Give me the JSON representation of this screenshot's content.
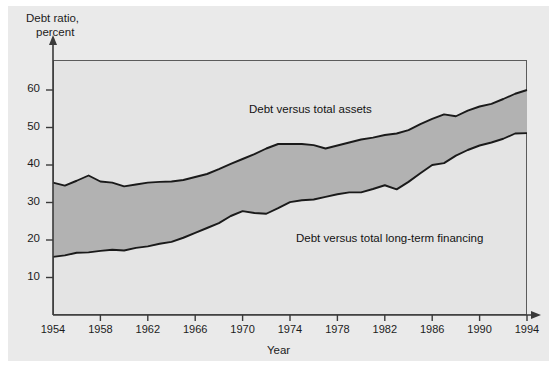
{
  "figure": {
    "background_color": "#ffffff",
    "panel_color": "#eaeaea",
    "plot_background_color": "#e4e4e4",
    "band_fill_color": "#b2b2b2",
    "line_color": "#1a1a1a",
    "axis_color": "#5b5b5b"
  },
  "chart_data": {
    "type": "area",
    "title": "",
    "subtitle": "",
    "xlabel": "Year",
    "ylabel": "Debt ratio, percent",
    "ylabel_line1": "Debt ratio,",
    "ylabel_line2": "percent",
    "xlim": [
      1954,
      1994
    ],
    "ylim": [
      0,
      68
    ],
    "yticks": [
      10,
      20,
      30,
      40,
      50,
      60
    ],
    "ytick_labels": [
      "10",
      "20",
      "30",
      "40",
      "50",
      "60"
    ],
    "xticks": [
      1954,
      1958,
      1962,
      1966,
      1970,
      1974,
      1978,
      1982,
      1986,
      1990,
      1994
    ],
    "xtick_labels": [
      "1954",
      "1958",
      "1962",
      "1966",
      "1970",
      "1974",
      "1978",
      "1982",
      "1986",
      "1990",
      "1994"
    ],
    "grid": false,
    "legend_position": "inline-annotations",
    "annotations": [
      {
        "text": "Debt versus total assets",
        "x": 1972,
        "y": 54
      },
      {
        "text": "Debt versus total long-term financing",
        "x": 1978,
        "y": 22
      }
    ],
    "x": [
      1954,
      1955,
      1956,
      1957,
      1958,
      1959,
      1960,
      1961,
      1962,
      1963,
      1964,
      1965,
      1966,
      1967,
      1968,
      1969,
      1970,
      1971,
      1972,
      1973,
      1974,
      1975,
      1976,
      1977,
      1978,
      1979,
      1980,
      1981,
      1982,
      1983,
      1984,
      1985,
      1986,
      1987,
      1988,
      1989,
      1990,
      1991,
      1992,
      1993,
      1994
    ],
    "series": [
      {
        "name": "Debt versus total assets",
        "values": [
          35.3,
          34.5,
          35.8,
          37.2,
          35.6,
          35.3,
          34.3,
          34.8,
          35.3,
          35.5,
          35.6,
          36.0,
          36.8,
          37.6,
          38.9,
          40.3,
          41.6,
          42.9,
          44.4,
          45.6,
          45.6,
          45.6,
          45.3,
          44.4,
          45.2,
          46.0,
          46.8,
          47.3,
          48.0,
          48.4,
          49.3,
          50.9,
          52.3,
          53.5,
          53.0,
          54.5,
          55.6,
          56.3,
          57.6,
          59.0,
          60.0
        ]
      },
      {
        "name": "Debt versus total long-term financing",
        "values": [
          15.5,
          15.9,
          16.6,
          16.7,
          17.1,
          17.4,
          17.2,
          17.9,
          18.3,
          19.0,
          19.5,
          20.6,
          21.9,
          23.2,
          24.5,
          26.4,
          27.7,
          27.2,
          27.0,
          28.5,
          30.1,
          30.6,
          30.8,
          31.5,
          32.2,
          32.7,
          32.7,
          33.6,
          34.6,
          33.5,
          35.5,
          37.8,
          40.0,
          40.5,
          42.5,
          44.0,
          45.2,
          46.0,
          47.0,
          48.4,
          48.5
        ]
      }
    ]
  }
}
